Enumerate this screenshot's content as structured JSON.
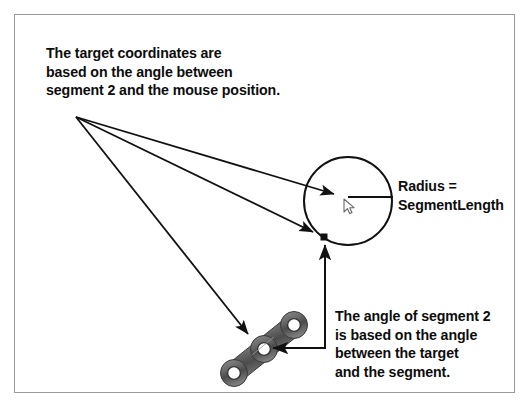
{
  "figure": {
    "background_color": "#ffffff",
    "frame_color": "#9a9a9a",
    "ink_color": "#111111",
    "chain_color": "#5a5a5a"
  },
  "annotations": {
    "target_note": "The target coordinates are\nbased on the angle between\nsegment 2 and the mouse position.",
    "radius_note": "Radius =\nSegmentLength",
    "angle_note": "The angle of segment 2\nis based on the angle\nbetween the target\nand the segment."
  },
  "labels": {
    "radius_line_1": "Radius =",
    "radius_line_2": "SegmentLength"
  },
  "graphics": {
    "circle": {
      "name": "reach-circle",
      "center_x": 348,
      "center_y": 201,
      "radius": 44
    },
    "radius_line": {
      "name": "radius-line",
      "x1": 348,
      "y1": 197,
      "x2": 392,
      "y2": 197
    },
    "mouse_cursor": {
      "name": "mouse-cursor",
      "x": 345,
      "y": 200
    },
    "target_point": {
      "name": "target-point",
      "x": 324,
      "y": 237,
      "size": 7
    },
    "chain": {
      "name": "chain-segments",
      "joints": [
        {
          "x": 294,
          "y": 325
        },
        {
          "x": 264,
          "y": 349
        },
        {
          "x": 234,
          "y": 373
        }
      ],
      "link_half_width": 11
    },
    "leader_origin": {
      "x": 76,
      "y": 117
    },
    "leaders": [
      {
        "name": "leader-to-mouse",
        "x1": 76,
        "y1": 117,
        "x2": 340,
        "y2": 196
      },
      {
        "name": "leader-to-target",
        "x1": 76,
        "y1": 117,
        "x2": 318,
        "y2": 234
      },
      {
        "name": "leader-to-chain",
        "x1": 76,
        "y1": 117,
        "x2": 253,
        "y2": 339
      }
    ],
    "angle_callout": {
      "name": "angle-callout-path",
      "points": "325,340 325,348 277,348",
      "up_arrow": {
        "x": 325,
        "y": 248
      },
      "up_line": {
        "x1": 325,
        "y1": 348,
        "x2": 325,
        "y2": 250
      }
    }
  }
}
